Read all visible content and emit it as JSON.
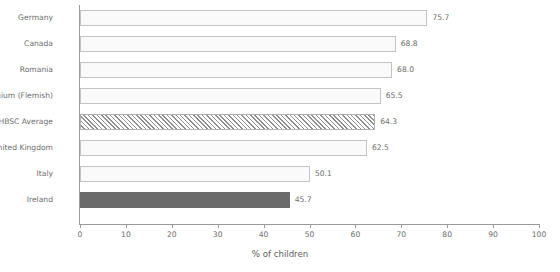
{
  "chart_data": {
    "type": "bar",
    "orientation": "horizontal",
    "title": "",
    "subtitle": "",
    "xlabel": "% of children",
    "ylabel": "",
    "xlim": [
      0,
      100
    ],
    "xticks": [
      0,
      10,
      20,
      30,
      40,
      50,
      60,
      70,
      80,
      90,
      100
    ],
    "xtick_labels": [
      "0",
      "10",
      "20",
      "30",
      "40",
      "50",
      "60",
      "70",
      "80",
      "90",
      "100"
    ],
    "grid": false,
    "legend": "none",
    "categories": [
      "Germany",
      "Canada",
      "Romania",
      "Belgium (Flemish)",
      "HBSC Average",
      "United Kingdom",
      "Italy",
      "Ireland"
    ],
    "values": [
      75.7,
      68.8,
      68.0,
      65.5,
      64.3,
      62.5,
      50.1,
      45.7
    ],
    "value_labels": [
      "75.7",
      "68.8",
      "68.0",
      "65.5",
      "64.3",
      "62.5",
      "50.1",
      "45.7"
    ],
    "bar_styles": [
      "outline",
      "outline",
      "outline",
      "outline",
      "hatched",
      "outline",
      "outline",
      "solid"
    ]
  },
  "colors": {
    "outline_fill": "#fafafa",
    "outline_border": "#c4c4c4",
    "solid_fill": "#6b6b6b",
    "hatch_line": "#8f8f8f",
    "axis": "#9a9a9a",
    "text": "#6d6d6d",
    "background": "#ffffff"
  }
}
